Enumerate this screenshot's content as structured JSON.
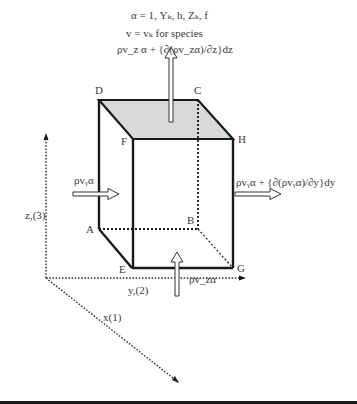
{
  "header": {
    "line1": "α = 1, Yₖ, h, Zₖ, f",
    "line2": "v = vₖ for species",
    "line3": "ρv_z α + {∂(ρv_zα)/∂z}dz"
  },
  "vertices": {
    "A": "A",
    "B": "B",
    "C": "C",
    "D": "D",
    "E": "E",
    "F": "F",
    "G": "G",
    "H": "H"
  },
  "fluxes": {
    "left_in": "ρvᵧα",
    "right_out": "ρvᵧα + {∂(ρvᵧα)/∂y}dy",
    "bottom_in": "ρv_zα"
  },
  "axes": {
    "x": "x(1)",
    "y": "y,(2)",
    "z": "z,(3)"
  },
  "colors": {
    "top_face": "#d9d9d9",
    "edges": "#1a1a1a"
  }
}
